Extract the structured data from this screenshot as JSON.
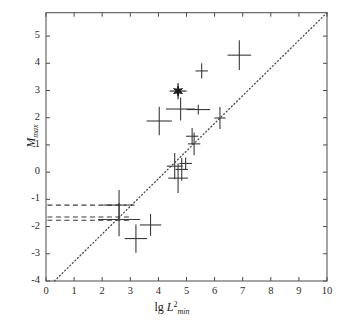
{
  "chart_data": {
    "type": "scatter",
    "title": "",
    "subtitle": "",
    "xlabel": "lg L2min",
    "xlabel_parts": {
      "lead": "lg ",
      "italic": "L",
      "sup": "2",
      "sub": "min"
    },
    "ylabel": "Mmax",
    "ylabel_parts": {
      "italic": "M",
      "sub": "max"
    },
    "xlim": [
      0,
      10
    ],
    "ylim": [
      -4,
      5.86
    ],
    "xticks": [
      0,
      1,
      2,
      3,
      4,
      5,
      6,
      7,
      8,
      9,
      10
    ],
    "xtick_labels": [
      "0",
      "1",
      "2",
      "3",
      "4",
      "5",
      "6",
      "7",
      "8",
      "9",
      "10"
    ],
    "yticks": [
      -4,
      -3,
      -2,
      -1,
      0,
      1,
      2,
      3,
      4,
      5
    ],
    "ytick_labels": [
      "-4",
      "-3",
      "-2",
      "-1",
      "0",
      "1",
      "2",
      "3",
      "4",
      "5"
    ],
    "grid": false,
    "legend": "none",
    "axis_color": "#4a4a4a",
    "marker_color": "#3a3a3a",
    "star_color": "#1a1a1a",
    "reference_line": {
      "style": "dotted",
      "color": "#4a4a4a",
      "x": [
        0.3,
        10.0
      ],
      "y": [
        -4.0,
        5.86
      ],
      "comment": "dotted 1:1 reference line"
    },
    "dashed_lines": [
      {
        "y": -1.21,
        "x_start": 0.05,
        "x_end": 2.85,
        "style": "dashed"
      },
      {
        "y": -1.65,
        "x_start": 0.05,
        "x_end": 2.95,
        "style": "dashed"
      },
      {
        "y": -1.77,
        "x_start": 0.05,
        "x_end": 2.95,
        "style": "dashed"
      }
    ],
    "series": [
      {
        "name": "data-with-error-bars",
        "marker": "cross-errorbar",
        "points": [
          {
            "x": 2.6,
            "y": -1.21,
            "xerr": 0.55,
            "yerr": 0.55
          },
          {
            "x": 2.6,
            "y": -1.74,
            "xerr": 0.75,
            "yerr": 0.62
          },
          {
            "x": 3.2,
            "y": -2.44,
            "xerr": 0.4,
            "yerr": 0.52
          },
          {
            "x": 3.72,
            "y": -1.94,
            "xerr": 0.38,
            "yerr": 0.4
          },
          {
            "x": 4.03,
            "y": 1.88,
            "xerr": 0.45,
            "yerr": 0.52
          },
          {
            "x": 4.58,
            "y": 0.22,
            "xerr": 0.28,
            "yerr": 0.48
          },
          {
            "x": 4.7,
            "y": -0.22,
            "xerr": 0.35,
            "yerr": 0.55
          },
          {
            "x": 4.79,
            "y": 2.32,
            "xerr": 0.52,
            "yerr": 0.42
          },
          {
            "x": 4.83,
            "y": 0.1,
            "xerr": 0.22,
            "yerr": 0.42
          },
          {
            "x": 4.97,
            "y": 0.32,
            "xerr": 0.22,
            "yerr": 0.22
          },
          {
            "x": 5.2,
            "y": 1.32,
            "xerr": 0.22,
            "yerr": 0.3
          },
          {
            "x": 5.27,
            "y": 1.04,
            "xerr": 0.22,
            "yerr": 0.42
          },
          {
            "x": 5.42,
            "y": 2.3,
            "xerr": 0.42,
            "yerr": 0.18
          },
          {
            "x": 5.54,
            "y": 3.72,
            "xerr": 0.22,
            "yerr": 0.28
          },
          {
            "x": 6.19,
            "y": 1.99,
            "xerr": 0.2,
            "yerr": 0.4
          },
          {
            "x": 6.88,
            "y": 4.3,
            "xerr": 0.42,
            "yerr": 0.55
          }
        ]
      },
      {
        "name": "highlighted-event",
        "marker": "star",
        "points": [
          {
            "x": 4.7,
            "y": 2.98,
            "xerr": 0.3,
            "yerr": 0.3
          }
        ]
      }
    ]
  }
}
